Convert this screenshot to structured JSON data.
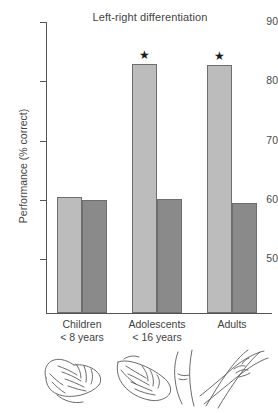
{
  "figure": {
    "title": "Left-right differentiation",
    "ylabel": "Performance (% correct)"
  },
  "chart_data": {
    "type": "bar",
    "title": "Left-right differentiation",
    "xlabel": "",
    "ylabel": "Performance (% correct)",
    "ylim": [
      41.5,
      90
    ],
    "yticks": [
      50,
      60,
      70,
      80,
      90
    ],
    "ytick_labels": [
      "50",
      "60",
      "70",
      "80",
      "90"
    ],
    "grid": false,
    "legend": "none",
    "categories": [
      "Children",
      "Adolescents",
      "Adults"
    ],
    "category_sublabels": [
      "< 8 years",
      "< 16 years",
      ""
    ],
    "series": [
      {
        "name": "light-bar",
        "color": "#bcbcbc",
        "values": [
          61.1,
          83.5,
          83.4
        ],
        "annotations": [
          "",
          "★",
          "★"
        ]
      },
      {
        "name": "dark-bar",
        "color": "#8a8a8a",
        "values": [
          60.6,
          60.8,
          60.1
        ],
        "annotations": [
          "",
          "",
          ""
        ]
      }
    ],
    "annotation_note": "Stars (★) mark significant bars in the Adolescents and Adults light-bar conditions."
  },
  "yticks": [
    {
      "label": "90",
      "top": 22
    },
    {
      "label": "80",
      "top": 81.3
    },
    {
      "label": "70",
      "top": 140.5
    },
    {
      "label": "60",
      "top": 199.8
    },
    {
      "label": "50",
      "top": 259.0
    }
  ],
  "bars": [
    {
      "name": "children-light",
      "left": 10,
      "width": 25,
      "height": 116,
      "tone": "light",
      "star": ""
    },
    {
      "name": "children-dark",
      "left": 35,
      "width": 25,
      "height": 113,
      "tone": "dark",
      "star": ""
    },
    {
      "name": "adolescents-light",
      "left": 85,
      "width": 25,
      "height": 249,
      "tone": "light",
      "star": "★"
    },
    {
      "name": "adolescents-dark",
      "left": 110,
      "width": 25,
      "height": 114,
      "tone": "dark",
      "star": ""
    },
    {
      "name": "adults-light",
      "left": 160,
      "width": 25,
      "height": 248,
      "tone": "light",
      "star": "★"
    },
    {
      "name": "adults-dark",
      "left": 185,
      "width": 25,
      "height": 110,
      "tone": "dark",
      "star": ""
    }
  ],
  "categories": [
    {
      "name": "children",
      "label": "Children",
      "sublabel": "< 8 years",
      "center": 82
    },
    {
      "name": "adolescents",
      "label": "Adolescents",
      "sublabel": "< 16 years",
      "center": 157
    },
    {
      "name": "adults",
      "label": "Adults",
      "sublabel": "",
      "center": 232
    }
  ],
  "sketches": [
    {
      "name": "hand-sketch-children",
      "caption": "hand with interlaced fingers"
    },
    {
      "name": "hand-sketch-adolescents",
      "caption": "hand with interlaced fingers and forearm"
    },
    {
      "name": "hand-sketch-adults",
      "caption": "crossed forearms"
    }
  ]
}
